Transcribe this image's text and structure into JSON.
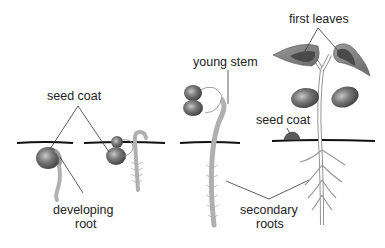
{
  "diagram": {
    "colors": {
      "background": "#ffffff",
      "ground_line": "#111111",
      "seed": "#5e5e5e",
      "seed_highlight": "#b5b5b5",
      "root_stem": "#b0b0b0",
      "leaf_outer": "#7a7a7a",
      "leaf_inner": "#4a4a4a",
      "leader_line": "#333333",
      "text": "#222222"
    },
    "labels": {
      "seed_coat_left": "seed coat",
      "developing_root_line1": "developing",
      "developing_root_line2": "root",
      "young_stem": "young stem",
      "first_leaves": "first leaves",
      "seed_coat_right": "seed coat",
      "secondary_roots_line1": "secondary",
      "secondary_roots_line2": "roots"
    },
    "stages": [
      {
        "id": 1,
        "name": "seed with developing root"
      },
      {
        "id": 2,
        "name": "seed with root and root hairs"
      },
      {
        "id": 3,
        "name": "seedling with young stem hook"
      },
      {
        "id": 4,
        "name": "seedling with first leaves"
      }
    ]
  }
}
